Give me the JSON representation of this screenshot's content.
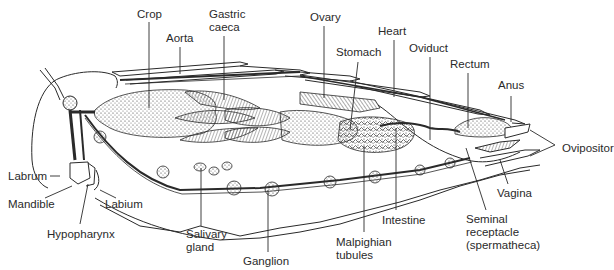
{
  "figure": {
    "background": "#ffffff",
    "ink_color": "#2a2a2a"
  },
  "labels": [
    {
      "id": "crop",
      "text": "Crop",
      "x": 137,
      "y": 8
    },
    {
      "id": "gastric-caeca",
      "text": "Gastric\ncaeca",
      "x": 209,
      "y": 8
    },
    {
      "id": "aorta",
      "text": "Aorta",
      "x": 166,
      "y": 32
    },
    {
      "id": "ovary",
      "text": "Ovary",
      "x": 310,
      "y": 11
    },
    {
      "id": "heart",
      "text": "Heart",
      "x": 378,
      "y": 25
    },
    {
      "id": "stomach",
      "text": "Stomach",
      "x": 336,
      "y": 46
    },
    {
      "id": "oviduct",
      "text": "Oviduct",
      "x": 409,
      "y": 42
    },
    {
      "id": "rectum",
      "text": "Rectum",
      "x": 450,
      "y": 58
    },
    {
      "id": "anus",
      "text": "Anus",
      "x": 498,
      "y": 79
    },
    {
      "id": "ovipositor",
      "text": "Ovipositor",
      "x": 562,
      "y": 142
    },
    {
      "id": "labrum",
      "text": "Labrum",
      "x": 8,
      "y": 172
    },
    {
      "id": "mandible",
      "text": "Mandible",
      "x": 8,
      "y": 200
    },
    {
      "id": "labium",
      "text": "Labium",
      "x": 105,
      "y": 200
    },
    {
      "id": "hypopharynx",
      "text": "Hypopharynx",
      "x": 47,
      "y": 229
    },
    {
      "id": "salivary-gland",
      "text": "Salivary\ngland",
      "x": 186,
      "y": 228
    },
    {
      "id": "ganglion",
      "text": "Ganglion",
      "x": 243,
      "y": 255
    },
    {
      "id": "intestine",
      "text": "Intestine",
      "x": 382,
      "y": 214
    },
    {
      "id": "malpighian-tubules",
      "text": "Malpighian\ntubules",
      "x": 336,
      "y": 236
    },
    {
      "id": "vagina",
      "text": "Vagina",
      "x": 497,
      "y": 187
    },
    {
      "id": "seminal-receptacle",
      "text": "Seminal\nreceptacle\n(spermatheca)",
      "x": 466,
      "y": 213
    }
  ]
}
